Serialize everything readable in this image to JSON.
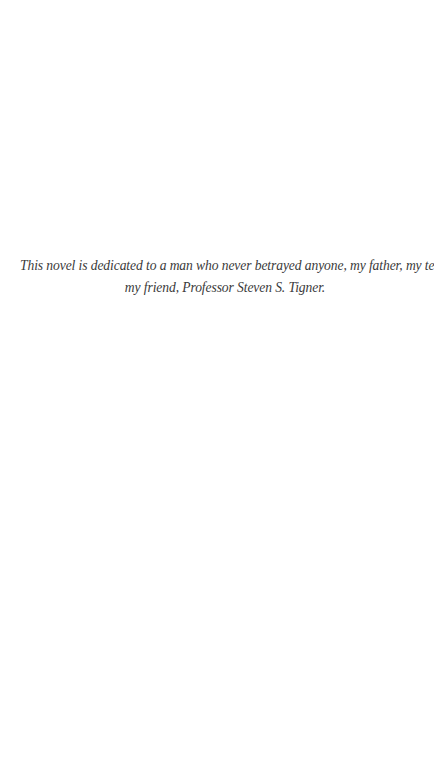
{
  "page": {
    "dedication": {
      "line1": "This novel is dedicated to a man who never betrayed anyone, my father, my teacher,",
      "line2": "my friend, Professor Steven S. Tigner."
    }
  },
  "colors": {
    "background": "#ffffff",
    "text": "#3a3a3a"
  }
}
